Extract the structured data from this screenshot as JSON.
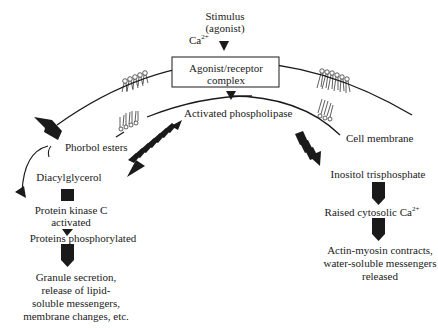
{
  "diagram": {
    "top": {
      "stimulus_line1": "Stimulus",
      "stimulus_line2": "(agonist)",
      "calcium": "Ca",
      "calcium_sup": "2+"
    },
    "receptor_box": {
      "line1": "Agonist/receptor",
      "line2": "complex"
    },
    "activated_phospholipase": "Activated phospholipase",
    "phorbol_esters": "Phorbol esters",
    "cell_membrane": "Cell membrane",
    "left_branch": {
      "diacylglycerol": "Diacylglycerol",
      "pkc_line1": "Protein kinase C",
      "pkc_line2": "activated",
      "proteins_phosphorylated": "Proteins phosphorylated",
      "outcome_line1": "Granule secretion,",
      "outcome_line2": "release of lipid-",
      "outcome_line3": "soluble messengers,",
      "outcome_line4": "membrane changes, etc."
    },
    "right_branch": {
      "ip3": "Inositol trisphosphate",
      "raised_ca": "Raised cytosolic Ca",
      "raised_ca_sup": "2+",
      "outcome_line1": "Actin-myosin contracts,",
      "outcome_line2": "water-soluble messengers",
      "outcome_line3": "released"
    },
    "colors": {
      "ink": "#1a1a1a",
      "background": "#ffffff"
    }
  }
}
